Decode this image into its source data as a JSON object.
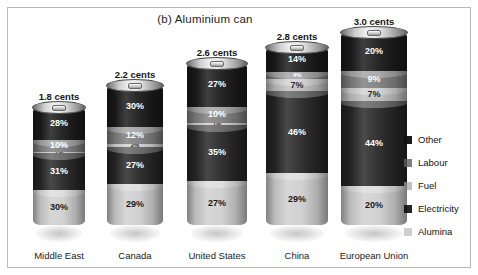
{
  "figure": {
    "title": "(b) Aluminium can"
  },
  "legend": {
    "position": "right",
    "items": [
      {
        "label": "Other",
        "color": "#1a1a1a"
      },
      {
        "label": "Labour",
        "color": "#7f7f7f"
      },
      {
        "label": "Fuel",
        "color": "#bfbfbf"
      },
      {
        "label": "Electricity",
        "color": "#262626"
      },
      {
        "label": "Alumina",
        "color": "#cfcfcf"
      }
    ]
  },
  "chart_data": {
    "type": "bar",
    "subtype": "stacked-cylinder-100-percent",
    "title": "(b) Aluminium can",
    "xlabel": "",
    "ylabel": "",
    "ylim": [
      0,
      100
    ],
    "grid": false,
    "legend_position": "right",
    "unit": "percent",
    "categories": [
      "Middle East",
      "Canada",
      "United States",
      "China",
      "European Union"
    ],
    "stack_order_bottom_to_top": [
      "Alumina",
      "Electricity",
      "Fuel",
      "Labour",
      "Other"
    ],
    "series": [
      {
        "name": "Alumina",
        "color": "#cfcfcf",
        "text_color": "#1a1a1a",
        "values": [
          30,
          29,
          27,
          29,
          20
        ]
      },
      {
        "name": "Electricity",
        "color": "#262626",
        "text_color": "#ffffff",
        "values": [
          31,
          27,
          35,
          46,
          44
        ]
      },
      {
        "name": "Fuel",
        "color": "#bfbfbf",
        "text_color": "#1a1a1a",
        "values": [
          1,
          2,
          1,
          7,
          7
        ]
      },
      {
        "name": "Labour",
        "color": "#7f7f7f",
        "text_color": "#ffffff",
        "values": [
          10,
          12,
          10,
          4,
          9
        ]
      },
      {
        "name": "Other",
        "color": "#1a1a1a",
        "text_color": "#ffffff",
        "values": [
          28,
          30,
          27,
          14,
          20
        ]
      }
    ],
    "annotations": [
      {
        "category": "Middle East",
        "text": "1.8 cents",
        "value": 1.8
      },
      {
        "category": "Canada",
        "text": "2.2 cents",
        "value": 2.2
      },
      {
        "category": "United States",
        "text": "2.6 cents",
        "value": 2.6
      },
      {
        "category": "China",
        "text": "2.8 cents",
        "value": 2.8
      },
      {
        "category": "European Union",
        "text": "3.0 cents",
        "value": 3.0
      }
    ],
    "bars": [
      {
        "category": "Middle East",
        "cost_label": "1.8 cents",
        "cost_value": 1.8,
        "segments": [
          {
            "name": "Other",
            "label": "28%",
            "value": 28,
            "color": "#1a1a1a",
            "text_color": "#ffffff"
          },
          {
            "name": "Labour",
            "label": "10%",
            "value": 10,
            "color": "#7f7f7f",
            "text_color": "#ffffff"
          },
          {
            "name": "Fuel",
            "label": "1%",
            "value": 1,
            "color": "#bfbfbf",
            "text_color": "#2b2b2b"
          },
          {
            "name": "Electricity",
            "label": "31%",
            "value": 31,
            "color": "#262626",
            "text_color": "#ffffff"
          },
          {
            "name": "Alumina",
            "label": "30%",
            "value": 30,
            "color": "#cfcfcf",
            "text_color": "#1a1a1a"
          }
        ]
      },
      {
        "category": "Canada",
        "cost_label": "2.2 cents",
        "cost_value": 2.2,
        "segments": [
          {
            "name": "Other",
            "label": "30%",
            "value": 30,
            "color": "#1a1a1a",
            "text_color": "#ffffff"
          },
          {
            "name": "Labour",
            "label": "12%",
            "value": 12,
            "color": "#7f7f7f",
            "text_color": "#ffffff"
          },
          {
            "name": "Fuel",
            "label": "2%",
            "value": 2,
            "color": "#bfbfbf",
            "text_color": "#2b2b2b"
          },
          {
            "name": "Electricity",
            "label": "27%",
            "value": 27,
            "color": "#262626",
            "text_color": "#ffffff"
          },
          {
            "name": "Alumina",
            "label": "29%",
            "value": 29,
            "color": "#cfcfcf",
            "text_color": "#1a1a1a"
          }
        ]
      },
      {
        "category": "United States",
        "cost_label": "2.6 cents",
        "cost_value": 2.6,
        "segments": [
          {
            "name": "Other",
            "label": "27%",
            "value": 27,
            "color": "#1a1a1a",
            "text_color": "#ffffff"
          },
          {
            "name": "Labour",
            "label": "10%",
            "value": 10,
            "color": "#7f7f7f",
            "text_color": "#ffffff"
          },
          {
            "name": "Fuel",
            "label": "1%",
            "value": 1,
            "color": "#bfbfbf",
            "text_color": "#2b2b2b"
          },
          {
            "name": "Electricity",
            "label": "35%",
            "value": 35,
            "color": "#262626",
            "text_color": "#ffffff"
          },
          {
            "name": "Alumina",
            "label": "27%",
            "value": 27,
            "color": "#cfcfcf",
            "text_color": "#1a1a1a"
          }
        ]
      },
      {
        "category": "China",
        "cost_label": "2.8 cents",
        "cost_value": 2.8,
        "segments": [
          {
            "name": "Other",
            "label": "14%",
            "value": 14,
            "color": "#1a1a1a",
            "text_color": "#ffffff"
          },
          {
            "name": "Labour",
            "label": "4%",
            "value": 4,
            "color": "#7f7f7f",
            "text_color": "#ffffff"
          },
          {
            "name": "Fuel",
            "label": "7%",
            "value": 7,
            "color": "#bfbfbf",
            "text_color": "#2b2b2b"
          },
          {
            "name": "Electricity",
            "label": "46%",
            "value": 46,
            "color": "#262626",
            "text_color": "#ffffff"
          },
          {
            "name": "Alumina",
            "label": "29%",
            "value": 29,
            "color": "#cfcfcf",
            "text_color": "#1a1a1a"
          }
        ]
      },
      {
        "category": "European Union",
        "cost_label": "3.0 cents",
        "cost_value": 3.0,
        "segments": [
          {
            "name": "Other",
            "label": "20%",
            "value": 20,
            "color": "#1a1a1a",
            "text_color": "#ffffff"
          },
          {
            "name": "Labour",
            "label": "9%",
            "value": 9,
            "color": "#7f7f7f",
            "text_color": "#ffffff"
          },
          {
            "name": "Fuel",
            "label": "7%",
            "value": 7,
            "color": "#bfbfbf",
            "text_color": "#2b2b2b"
          },
          {
            "name": "Electricity",
            "label": "44%",
            "value": 44,
            "color": "#262626",
            "text_color": "#ffffff"
          },
          {
            "name": "Alumina",
            "label": "20%",
            "value": 20,
            "color": "#cfcfcf",
            "text_color": "#1a1a1a"
          }
        ]
      }
    ]
  },
  "layout": {
    "bar_heights_px": [
      118,
      140,
      162,
      178,
      193
    ],
    "bar_widths_px": [
      52,
      56,
      60,
      62,
      66
    ],
    "bar_centers_px": [
      45,
      121,
      203,
      283,
      360
    ]
  }
}
